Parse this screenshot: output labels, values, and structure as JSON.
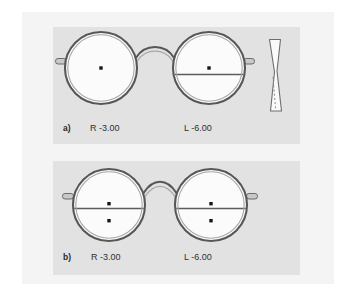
{
  "figure": {
    "width": 349,
    "height": 293,
    "background_color": "#ffffff",
    "sheet_color": "#f4f4f4",
    "panel_color": "#e2e2e2",
    "frame_color": "#555555",
    "frame_highlight_color": "#9a9a9a",
    "lens_fill_color": "#fbfbfb",
    "marking_color": "#1a1a1a",
    "text_color": "#303030"
  },
  "panels": [
    {
      "id": "a",
      "letter": "a)",
      "right_lens": {
        "eye_label": "R -3.00",
        "has_segment_line": false,
        "dots": 1,
        "dot_labels": [
          "optical-center-dot"
        ]
      },
      "left_lens": {
        "eye_label": "L -6.00",
        "has_segment_line": true,
        "dots": 1,
        "dot_labels": [
          "optical-center-dot"
        ]
      },
      "has_lens_cross_section": true,
      "lens_cross_section": {
        "name": "minus-lens-profile",
        "shape": "biconcave",
        "has_dashed_axis": true
      }
    },
    {
      "id": "b",
      "letter": "b)",
      "right_lens": {
        "eye_label": "R -3.00",
        "has_segment_line": true,
        "dots": 2,
        "dot_labels": [
          "optical-center-dot",
          "near-reference-dot"
        ]
      },
      "left_lens": {
        "eye_label": "L -6.00",
        "has_segment_line": true,
        "dots": 2,
        "dot_labels": [
          "optical-center-dot",
          "near-reference-dot"
        ]
      },
      "has_lens_cross_section": false
    }
  ]
}
